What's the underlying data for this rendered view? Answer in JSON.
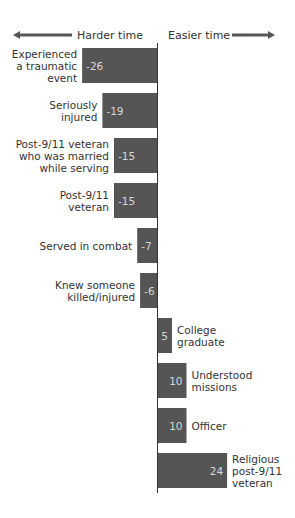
{
  "chart_data": {
    "type": "bar",
    "orientation": "horizontal",
    "title": "",
    "xlabel": "",
    "ylabel": "",
    "direction_labels": {
      "negative": "Harder time",
      "positive": "Easier time"
    },
    "categories": [
      "Experienced a traumatic event",
      "Seriously injured",
      "Post-9/11 veteran who was married while serving",
      "Post-9/11 veteran",
      "Served in combat",
      "Knew someone killed/injured",
      "College graduate",
      "Understood missions",
      "Officer",
      "Religious post-9/11 veteran"
    ],
    "category_lines": [
      [
        "Experienced",
        "a traumatic",
        "event"
      ],
      [
        "Seriously",
        "injured"
      ],
      [
        "Post-9/11 veteran",
        "who was married",
        "while serving"
      ],
      [
        "Post-9/11",
        "veteran"
      ],
      [
        "Served in combat"
      ],
      [
        "Knew someone",
        "killed/injured"
      ],
      [
        "College",
        "graduate"
      ],
      [
        "Understood",
        "missions"
      ],
      [
        "Officer"
      ],
      [
        "Religious",
        "post-9/11",
        "veteran"
      ]
    ],
    "values": [
      -26,
      -19,
      -15,
      -15,
      -7,
      -6,
      5,
      10,
      10,
      24
    ],
    "xlim": [
      -27,
      40
    ],
    "grid": false,
    "legend": "none",
    "colors": {
      "bar": "#555555",
      "axis": "#333333",
      "arrow": "#555555"
    }
  }
}
